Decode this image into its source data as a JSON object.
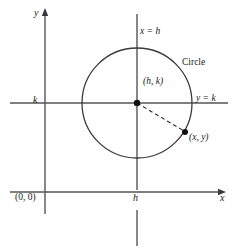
{
  "figure": {
    "type": "geometry-diagram",
    "background_color": "#ffffff",
    "ink_color": "#1a1a1a",
    "axis_color": "#555555",
    "labels": {
      "y_axis": "y",
      "x_axis": "x",
      "k_tick": "k",
      "h_tick": "h",
      "origin": "(0, 0)",
      "vertical_line": "x = h",
      "horizontal_line": "y = k",
      "circle": "Circle",
      "center_point": "(h, k)",
      "circle_point": "(x, y)"
    },
    "geometry": {
      "origin_px": {
        "x": 45,
        "y": 192
      },
      "center_px": {
        "x": 137,
        "y": 103
      },
      "radius_px": 55,
      "point_xy_px": {
        "x": 185,
        "y": 132
      },
      "x_axis_y_px": 192,
      "y_axis_x_px": 45,
      "line_x_equals_h_px": 137,
      "line_y_equals_k_px": 103
    }
  }
}
